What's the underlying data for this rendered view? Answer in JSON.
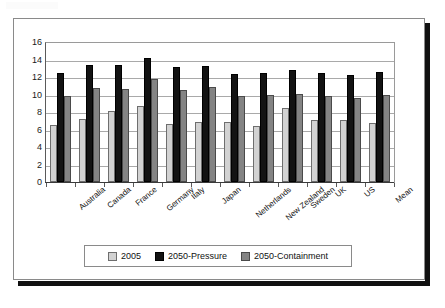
{
  "chart_data": {
    "type": "bar",
    "title": "",
    "subtitle": "",
    "xlabel": "",
    "ylabel": "",
    "ylim": [
      0,
      16
    ],
    "ytick_step": 2,
    "yticks": [
      16,
      14,
      12,
      10,
      8,
      6,
      4,
      2,
      0
    ],
    "grid": true,
    "legend_position": "bottom",
    "categories": [
      "Australia",
      "Canada",
      "France",
      "Germany",
      "Italy",
      "Japan",
      "Netherlands",
      "New Zealand",
      "Sweden",
      "UK",
      "US",
      "Mean"
    ],
    "series": [
      {
        "name": "2005",
        "color": "#d2d2d2",
        "values": [
          6.5,
          7.2,
          8.1,
          8.7,
          6.6,
          6.8,
          6.8,
          6.4,
          8.4,
          7.1,
          7.1,
          6.7
        ]
      },
      {
        "name": "2050-Pressure",
        "color": "#131313",
        "values": [
          12.5,
          13.4,
          13.4,
          14.2,
          13.1,
          13.3,
          12.3,
          12.5,
          12.8,
          12.5,
          12.2,
          12.6
        ]
      },
      {
        "name": "2050-Containment",
        "color": "#848484",
        "values": [
          9.8,
          10.7,
          10.6,
          11.8,
          10.5,
          10.8,
          9.8,
          9.9,
          10.0,
          9.8,
          9.6,
          9.9
        ]
      }
    ]
  },
  "legend": {
    "items": [
      {
        "label": "2005",
        "swatch": "light-gray-swatch"
      },
      {
        "label": "2050-Pressure",
        "swatch": "black-swatch"
      },
      {
        "label": "2050-Containment",
        "swatch": "medium-gray-swatch"
      }
    ]
  }
}
